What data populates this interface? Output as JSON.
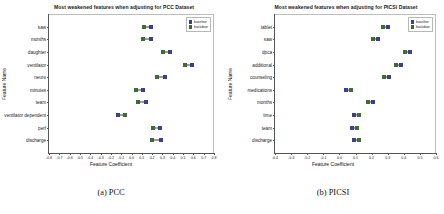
{
  "figure": {
    "panels": [
      {
        "caption": "(a) PCC",
        "title": "Most weakened features when adjusting for PCC Dataset",
        "xlabel": "Feature Coefficient",
        "ylabel": "Feature Name",
        "legend": {
          "baseline": "baseline",
          "backdoor": "backdoor"
        }
      },
      {
        "caption": "(b) PICSI",
        "title": "Most weakened features when adjusting for PICSI Dataset",
        "xlabel": "Feature Coefficient",
        "ylabel": "Feature Name",
        "legend": {
          "baseline": "baseline",
          "backdoor": "backdoor"
        }
      }
    ]
  },
  "colors": {
    "baseline": "#3b3f8f",
    "backdoor": "#3f6b34",
    "connector": "#3a3a3a",
    "axis": "#555555"
  },
  "chart_data": [
    {
      "type": "scatter",
      "subtype": "dumbbell",
      "title": "Most weakened features when adjusting for PCC Dataset",
      "xlabel": "Feature Coefficient",
      "ylabel": "Feature Name",
      "xlim": [
        -0.8,
        0.8
      ],
      "xticks": [
        -0.8,
        -0.7,
        -0.6,
        -0.5,
        -0.4,
        -0.3,
        -0.2,
        -0.1,
        0.0,
        0.1,
        0.2,
        0.3,
        0.4,
        0.5,
        0.6,
        0.7,
        0.8
      ],
      "xticklabels": [
        "-0.8",
        "-0.7",
        "-0.6",
        "-0.5",
        "-0.4",
        "-0.3",
        "-0.2",
        "-0.1",
        "0.0",
        "0.1",
        "0.2",
        "0.3",
        "0.4",
        "0.5",
        "0.6",
        "0.7",
        "0.8"
      ],
      "grid": false,
      "legend_position": "upper right",
      "categories": [
        "saw",
        "months",
        "daughter",
        "ventilator",
        "neuro",
        "minutes",
        "team",
        "ventilator dependent",
        "perf",
        "discharge"
      ],
      "series": [
        {
          "name": "backdoor",
          "values": [
            0.12,
            0.11,
            0.31,
            0.52,
            0.25,
            0.04,
            0.06,
            -0.06,
            0.21,
            0.2
          ]
        },
        {
          "name": "baseline",
          "values": [
            0.19,
            0.19,
            0.37,
            0.59,
            0.32,
            0.11,
            0.14,
            -0.13,
            0.28,
            0.29
          ]
        }
      ]
    },
    {
      "type": "scatter",
      "subtype": "dumbbell",
      "title": "Most weakened features when adjusting for PICSI Dataset",
      "xlabel": "Feature Coefficient",
      "ylabel": "Feature Name",
      "xlim": [
        -0.4,
        0.6
      ],
      "xticks": [
        -0.4,
        -0.3,
        -0.2,
        -0.1,
        0.0,
        0.1,
        0.2,
        0.3,
        0.4,
        0.5,
        0.6
      ],
      "xticklabels": [
        "-0.4",
        "-0.3",
        "-0.2",
        "-0.1",
        "0.0",
        "0.1",
        "0.2",
        "0.3",
        "0.4",
        "0.5",
        "0.6"
      ],
      "grid": false,
      "legend_position": "upper right",
      "categories": [
        "tablet",
        "saw",
        "dpca",
        "additional",
        "counseling",
        "medications",
        "months",
        "time",
        "team",
        "discharge"
      ],
      "series": [
        {
          "name": "backdoor",
          "values": [
            0.27,
            0.21,
            0.41,
            0.35,
            0.28,
            0.07,
            0.18,
            0.12,
            0.11,
            0.12
          ]
        },
        {
          "name": "baseline",
          "values": [
            0.3,
            0.24,
            0.44,
            0.38,
            0.31,
            0.04,
            0.21,
            0.09,
            0.08,
            0.09
          ]
        }
      ]
    }
  ]
}
